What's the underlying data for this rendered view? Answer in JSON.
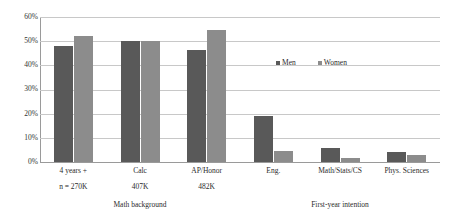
{
  "chart_data": {
    "type": "bar",
    "title": "",
    "subtitle": "",
    "xlabel": "",
    "ylabel": "",
    "ylim": [
      0,
      60
    ],
    "grid": true,
    "legend_position": "inside-right",
    "y_ticks": [
      "0%",
      "10%",
      "20%",
      "30%",
      "40%",
      "50%",
      "60%"
    ],
    "y_tick_values": [
      0,
      10,
      20,
      30,
      40,
      50,
      60
    ],
    "categories": [
      "4 years +",
      "Calc",
      "AP/Honor",
      "Eng.",
      "Math/Stats/CS",
      "Phys. Sciences"
    ],
    "category_sublabels": [
      "n = 270K",
      "407K",
      "482K",
      "",
      "",
      ""
    ],
    "series": [
      {
        "name": "Men",
        "color": "#595959",
        "values": [
          48,
          50,
          46.5,
          19,
          6,
          4
        ]
      },
      {
        "name": "Women",
        "color": "#8c8c8c",
        "values": [
          52,
          50,
          54.5,
          4.5,
          1.5,
          2.8
        ]
      }
    ],
    "group_titles": [
      "Math background",
      "First-year intention"
    ],
    "annotations": []
  },
  "legend": {
    "items": [
      {
        "label": "Men"
      },
      {
        "label": "Women"
      }
    ]
  },
  "axis": {
    "tick_0": "0%",
    "tick_10": "10%",
    "tick_20": "20%",
    "tick_30": "30%",
    "tick_40": "40%",
    "tick_50": "50%",
    "tick_60": "60%"
  },
  "categories": {
    "c0": "4 years +",
    "c1": "Calc",
    "c2": "AP/Honor",
    "c3": "Eng.",
    "c4": "Math/Stats/CS",
    "c5": "Phys. Sciences"
  },
  "sublabels": {
    "s0": "n = 270K",
    "s1": "407K",
    "s2": "482K",
    "s3": "",
    "s4": "",
    "s5": ""
  },
  "sections": {
    "left": "Math background",
    "right": "First-year intention"
  }
}
